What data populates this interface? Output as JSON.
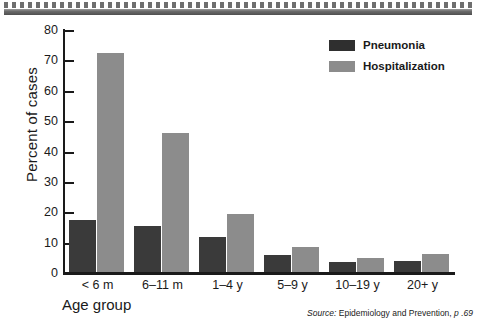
{
  "chart_data": {
    "type": "bar",
    "title": "",
    "subtitle": "",
    "xlabel": "Age group",
    "ylabel": "Percent of cases",
    "categories": [
      "< 6 m",
      "6–11 m",
      "1–4 y",
      "5–9 y",
      "10–19 y",
      "20+ y"
    ],
    "series": [
      {
        "name": "Pneumonia",
        "color": "#3a3a3a",
        "values": [
          17.2,
          15.3,
          11.5,
          5.6,
          3.4,
          3.7
        ]
      },
      {
        "name": "Hospitalization",
        "color": "#8c8c8c",
        "values": [
          72.0,
          45.7,
          19.1,
          8.1,
          4.6,
          6.0
        ]
      }
    ],
    "ylim": [
      0,
      80
    ],
    "yticks": [
      0,
      10,
      20,
      30,
      40,
      50,
      60,
      70,
      80
    ],
    "ytick_labels": [
      "0",
      "10",
      "20",
      "30",
      "40",
      "50",
      "60",
      "70",
      "80"
    ],
    "grid": false,
    "legend_position": "top-right",
    "annotations": [
      "Source: Epidemiology and Prevention, p .69"
    ]
  },
  "legend": {
    "items": [
      {
        "label": "Pneumonia"
      },
      {
        "label": "Hospitalization"
      }
    ]
  },
  "source": {
    "prefix": "Source:",
    "title": "Epidemiology and Prevention,",
    "page": "p .69"
  }
}
